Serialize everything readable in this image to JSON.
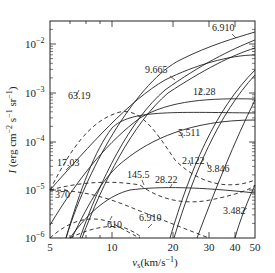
{
  "chart_data": {
    "type": "line",
    "title": "",
    "xlabel": "v_s (km/s^-1)",
    "ylabel": "I (erg cm^-2 s^-1 sr^-1)",
    "xscale": "log",
    "yscale": "log",
    "xlim": [
      5,
      50
    ],
    "ylim": [
      1e-06,
      0.03
    ],
    "x_ticks": [
      "5",
      "10",
      "20",
      "30",
      "40",
      "50"
    ],
    "y_ticks": [
      "10^-6",
      "10^-5",
      "10^-4",
      "10^-3",
      "10^-2"
    ],
    "grid": false,
    "legend": "inline curve labels (line wavelengths, μm)",
    "series": [
      {
        "name": "6.910",
        "style": "solid",
        "points": [
          [
            6,
            1e-06
          ],
          [
            10,
            0.00012
          ],
          [
            20,
            0.0025
          ],
          [
            30,
            0.008
          ],
          [
            50,
            0.02
          ]
        ]
      },
      {
        "name": "9.665",
        "style": "solid",
        "points": [
          [
            5,
            1.5e-05
          ],
          [
            10,
            0.00015
          ],
          [
            15,
            0.0008
          ],
          [
            20,
            0.002
          ],
          [
            30,
            0.004
          ],
          [
            50,
            0.005
          ]
        ]
      },
      {
        "name": "12.28",
        "style": "solid",
        "points": [
          [
            5,
            4e-06
          ],
          [
            10,
            5e-05
          ],
          [
            15,
            0.0002
          ],
          [
            20,
            0.0005
          ],
          [
            30,
            0.0007
          ],
          [
            50,
            0.0007
          ]
        ]
      },
      {
        "name": "17.03",
        "style": "solid",
        "points": [
          [
            6,
            1e-06
          ],
          [
            8,
            1.5e-05
          ],
          [
            10,
            0.0001
          ],
          [
            12,
            0.0003
          ],
          [
            20,
            0.0006
          ],
          [
            50,
            0.0004
          ]
        ]
      },
      {
        "name": "28.22",
        "style": "solid",
        "points": [
          [
            7,
            1e-06
          ],
          [
            10,
            5e-06
          ],
          [
            14,
            1.1e-05
          ],
          [
            20,
            1.1e-05
          ],
          [
            30,
            9e-06
          ],
          [
            50,
            8e-06
          ]
        ]
      },
      {
        "name": "5.511",
        "style": "solid",
        "points": [
          [
            8,
            1e-06
          ],
          [
            12,
            3e-05
          ],
          [
            20,
            0.001
          ],
          [
            30,
            0.005
          ],
          [
            50,
            0.015
          ]
        ]
      },
      {
        "name": "2.122",
        "style": "solid",
        "points": [
          [
            18,
            1e-06
          ],
          [
            25,
            0.0002
          ],
          [
            35,
            0.002
          ],
          [
            50,
            0.005
          ]
        ]
      },
      {
        "name": "3.846",
        "style": "solid",
        "points": [
          [
            25,
            1e-06
          ],
          [
            35,
            5e-05
          ],
          [
            50,
            0.001
          ]
        ]
      },
      {
        "name": "3.482",
        "style": "solid",
        "points": [
          [
            41,
            1e-06
          ],
          [
            50,
            1.5e-05
          ]
        ]
      },
      {
        "name": "63.19",
        "style": "dashed",
        "points": [
          [
            5,
            1.5e-05
          ],
          [
            8,
            0.00015
          ],
          [
            12,
            0.00035
          ],
          [
            16,
            0.00015
          ],
          [
            25,
            2e-05
          ],
          [
            40,
            1.5e-05
          ],
          [
            50,
            2e-05
          ]
        ]
      },
      {
        "name": "145.5",
        "style": "dashed",
        "points": [
          [
            5,
            1e-05
          ],
          [
            10,
            1.6e-05
          ],
          [
            15,
            1.4e-05
          ],
          [
            20,
            6e-06
          ],
          [
            30,
            7e-06
          ],
          [
            50,
            1.2e-05
          ]
        ]
      },
      {
        "name": "370",
        "style": "dashed",
        "points": [
          [
            5,
            1e-05
          ],
          [
            8,
            1.2e-05
          ],
          [
            12,
            8e-06
          ],
          [
            20,
            3e-06
          ],
          [
            30,
            1e-06
          ]
        ]
      },
      {
        "name": "610",
        "style": "dashed",
        "points": [
          [
            7,
            1e-06
          ],
          [
            10,
            1.8e-06
          ],
          [
            13,
            1.5e-06
          ],
          [
            15,
            1e-06
          ]
        ]
      },
      {
        "name": "6.910 (dashed)",
        "style": "dashed",
        "points": [
          [
            5,
            1e-06
          ],
          [
            8,
            5e-06
          ],
          [
            12,
            3e-06
          ],
          [
            15,
            1e-06
          ]
        ]
      }
    ],
    "labels": [
      "6.910",
      "9.665",
      "12.28",
      "63.19",
      "5.511",
      "17.03",
      "145.5",
      "2.122",
      "3.846",
      "28.22",
      "370",
      "610",
      "6.910",
      "3.482"
    ]
  }
}
